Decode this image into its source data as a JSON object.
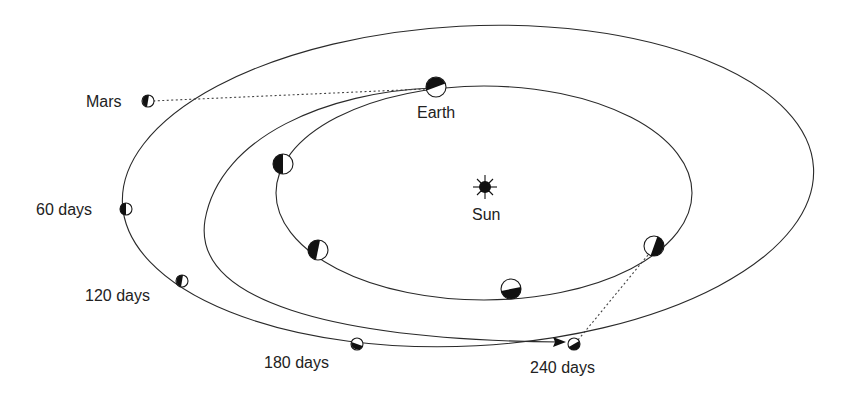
{
  "diagram": {
    "labels": {
      "earth": "Earth",
      "sun": "Sun",
      "mars": "Mars",
      "day60": "60 days",
      "day120": "120 days",
      "day180": "180 days",
      "day240": "240 days"
    },
    "orbits": [
      "Mars orbit (outer)",
      "Earth orbit (inner)",
      "Transfer orbit"
    ],
    "colors": {
      "line": "#2a2a2a",
      "shade": "#111111",
      "background": "#ffffff"
    }
  }
}
